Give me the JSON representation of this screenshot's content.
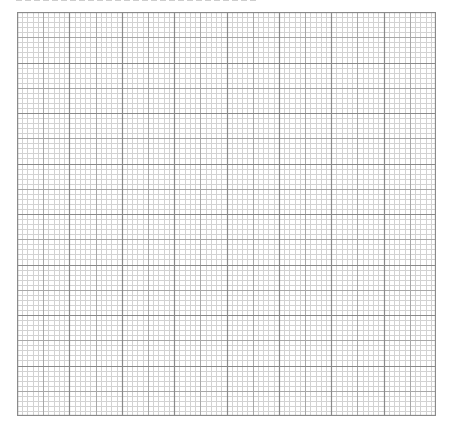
{
  "caption": {
    "text": "",
    "visible": "clipped at top edge, illegible"
  },
  "graph_paper": {
    "major_columns": 8,
    "major_rows": 8,
    "minor_divisions_per_major": 10,
    "mid_division_at": 5,
    "bounds": {
      "left": 17,
      "top": 12,
      "width": 419,
      "height": 404
    },
    "colors": {
      "background": "#ffffff",
      "major_line": "#8a8a8a",
      "mid_line": "#a8a8a8",
      "minor_line": "#d2d2d2",
      "border": "#8a8a8a"
    }
  }
}
